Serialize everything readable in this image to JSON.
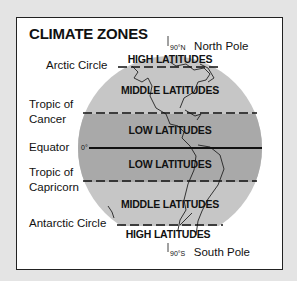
{
  "title": "CLIMATE ZONES",
  "colors": {
    "page_background": "#e4e4e4",
    "frame_background": "#ffffff",
    "globe_outer": "#c6c6c6",
    "globe_low_band": "#a9a9a9",
    "line": "#111111"
  },
  "poles": {
    "north": {
      "degree": "90°N",
      "label": "North Pole"
    },
    "south": {
      "degree": "90°S",
      "label": "South Pole"
    }
  },
  "latitude_lines": [
    {
      "name": "Arctic Circle",
      "label": "Arctic Circle",
      "style": "dashed"
    },
    {
      "name": "Tropic of Cancer",
      "label_line1": "Tropic of",
      "label_line2": "Cancer",
      "style": "dashed"
    },
    {
      "name": "Equator",
      "label": "Equator",
      "degree": "0°",
      "style": "solid"
    },
    {
      "name": "Tropic of Capricorn",
      "label_line1": "Tropic of",
      "label_line2": "Capricorn",
      "style": "dashed"
    },
    {
      "name": "Antarctic Circle",
      "label": "Antarctic Circle",
      "style": "dashed"
    }
  ],
  "zones": [
    {
      "label": "HIGH LATITUDES",
      "position": "north"
    },
    {
      "label": "MIDDLE LATITUDES",
      "position": "north"
    },
    {
      "label": "LOW LATITUDES",
      "position": "north"
    },
    {
      "label": "LOW LATITUDES",
      "position": "south"
    },
    {
      "label": "MIDDLE LATITUDES",
      "position": "south"
    },
    {
      "label": "HIGH LATITUDES",
      "position": "south"
    }
  ]
}
